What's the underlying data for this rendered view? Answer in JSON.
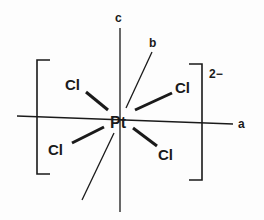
{
  "diagram": {
    "central_atom": "Pt",
    "ligands": [
      "Cl",
      "Cl",
      "Cl",
      "Cl"
    ],
    "charge": "2−",
    "axes": {
      "a": "a",
      "b": "b",
      "c": "c"
    },
    "colors": {
      "ink": "#1a1a1a",
      "background": "#fdfdfd"
    }
  }
}
